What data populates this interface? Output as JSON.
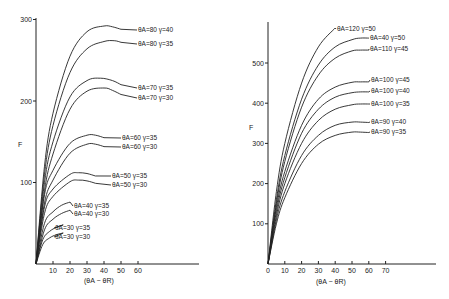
{
  "chart_data": [
    {
      "type": "line",
      "title": "",
      "xlabel": "(θA − θR)",
      "ylabel": "F",
      "xlim": [
        0,
        95
      ],
      "ylim": [
        0,
        300
      ],
      "x_ticks": [
        10,
        20,
        30,
        40,
        50,
        60
      ],
      "y_ticks": [
        100,
        200,
        300
      ],
      "grid": false,
      "legend_position": "inline labels at curve ends",
      "series": [
        {
          "name": "θA=80 γ=40",
          "x": [
            0,
            5,
            10,
            20,
            30,
            40,
            45,
            50
          ],
          "y": [
            0,
            120,
            185,
            255,
            285,
            292,
            291,
            288
          ]
        },
        {
          "name": "θA=80 γ=35",
          "x": [
            0,
            5,
            10,
            20,
            30,
            40,
            46,
            50
          ],
          "y": [
            0,
            110,
            170,
            235,
            264,
            273,
            274,
            272
          ]
        },
        {
          "name": "θA=70 γ=35",
          "x": [
            0,
            5,
            10,
            20,
            30,
            38,
            45,
            50
          ],
          "y": [
            0,
            100,
            150,
            205,
            225,
            228,
            225,
            220
          ]
        },
        {
          "name": "θA=70 γ=30",
          "x": [
            0,
            5,
            10,
            20,
            30,
            40,
            45,
            50
          ],
          "y": [
            0,
            90,
            135,
            190,
            212,
            216,
            213,
            208
          ]
        },
        {
          "name": "θA=60 γ=35",
          "x": [
            0,
            5,
            10,
            20,
            30,
            35,
            40
          ],
          "y": [
            0,
            85,
            115,
            148,
            158,
            158,
            155
          ]
        },
        {
          "name": "θA=60 γ=30",
          "x": [
            0,
            5,
            10,
            20,
            30,
            35,
            40
          ],
          "y": [
            0,
            75,
            103,
            136,
            147,
            147,
            144
          ]
        },
        {
          "name": "θA=50 γ=35",
          "x": [
            0,
            5,
            10,
            20,
            25,
            30,
            35
          ],
          "y": [
            0,
            70,
            92,
            110,
            112,
            111,
            108
          ]
        },
        {
          "name": "θA=50 γ=30",
          "x": [
            0,
            5,
            10,
            20,
            25,
            30,
            35
          ],
          "y": [
            0,
            62,
            83,
            101,
            103,
            102,
            99
          ]
        },
        {
          "name": "θA=40 γ=35",
          "x": [
            0,
            5,
            10,
            15,
            20
          ],
          "y": [
            0,
            50,
            64,
            72,
            76
          ]
        },
        {
          "name": "θA=40 γ=30",
          "x": [
            0,
            5,
            10,
            15,
            20
          ],
          "y": [
            0,
            42,
            55,
            62,
            66
          ]
        },
        {
          "name": "θA=30 γ=35",
          "x": [
            0,
            4,
            8,
            12,
            16
          ],
          "y": [
            0,
            30,
            40,
            45,
            48
          ]
        },
        {
          "name": "θA=30 γ=30",
          "x": [
            0,
            4,
            8,
            12,
            16
          ],
          "y": [
            0,
            24,
            32,
            36,
            38
          ]
        }
      ]
    },
    {
      "type": "line",
      "title": "",
      "xlabel": "(θA − θR)",
      "ylabel": "F",
      "xlim": [
        0,
        100
      ],
      "ylim": [
        0,
        600
      ],
      "x_ticks": [
        0,
        10,
        20,
        30,
        40,
        50,
        60,
        70
      ],
      "y_ticks": [
        100,
        200,
        300,
        400,
        500
      ],
      "grid": false,
      "legend_position": "inline labels at curve ends",
      "series": [
        {
          "name": "θA=120 γ=50",
          "x": [
            0,
            5,
            10,
            20,
            30,
            40
          ],
          "y": [
            0,
            180,
            300,
            450,
            540,
            587
          ]
        },
        {
          "name": "θA=40 γ=50",
          "x": [
            0,
            5,
            10,
            20,
            30,
            40,
            50,
            55,
            60
          ],
          "y": [
            0,
            160,
            270,
            410,
            495,
            540,
            558,
            562,
            562
          ]
        },
        {
          "name": "θA=110 γ=45",
          "x": [
            0,
            5,
            10,
            20,
            30,
            40,
            50,
            55,
            60
          ],
          "y": [
            0,
            150,
            255,
            390,
            470,
            512,
            530,
            532,
            532
          ]
        },
        {
          "name": "θA=100 γ=45",
          "x": [
            0,
            5,
            10,
            20,
            30,
            40,
            50,
            55,
            60
          ],
          "y": [
            0,
            140,
            230,
            345,
            410,
            440,
            452,
            453,
            453
          ]
        },
        {
          "name": "θA=100 γ=40",
          "x": [
            0,
            5,
            10,
            20,
            30,
            40,
            50,
            55,
            60
          ],
          "y": [
            0,
            130,
            215,
            325,
            385,
            415,
            426,
            428,
            428
          ]
        },
        {
          "name": "θA=100 γ=35",
          "x": [
            0,
            5,
            10,
            20,
            30,
            40,
            50,
            55,
            60
          ],
          "y": [
            0,
            120,
            200,
            300,
            357,
            385,
            396,
            398,
            398
          ]
        },
        {
          "name": "θA=90 γ=40",
          "x": [
            0,
            5,
            10,
            20,
            30,
            40,
            50,
            55,
            60
          ],
          "y": [
            0,
            110,
            180,
            270,
            320,
            345,
            353,
            353,
            352
          ]
        },
        {
          "name": "θA=90 γ=35",
          "x": [
            0,
            5,
            10,
            20,
            30,
            40,
            50,
            55,
            60
          ],
          "y": [
            0,
            100,
            165,
            250,
            298,
            320,
            328,
            328,
            327
          ]
        }
      ]
    }
  ],
  "left_chart": {
    "y_axis_label": "F",
    "x_axis_label": "(θA − θR)",
    "y_tick_labels": [
      "100",
      "200",
      "300"
    ],
    "x_tick_labels": [
      "10",
      "20",
      "30",
      "40",
      "50",
      "60"
    ],
    "series_labels": [
      "θA=80 γ=40",
      "θA=80 γ=35",
      "θA=70 γ=35",
      "θA=70 γ=30",
      "θA=60 γ=35",
      "θA=60 γ=30",
      "θA=50 γ=35",
      "θA=50 γ=30",
      "θA=40 γ=35",
      "θA=40 γ=30",
      "θA=30 γ=35",
      "θA=30 γ=30"
    ]
  },
  "right_chart": {
    "y_axis_label": "F",
    "x_axis_label": "(θA − θR)",
    "y_tick_labels": [
      "100",
      "200",
      "300",
      "400",
      "500"
    ],
    "x_tick_labels": [
      "0",
      "10",
      "20",
      "30",
      "40",
      "50",
      "60",
      "70"
    ],
    "series_labels": [
      "θA=120 γ=50",
      "θA=40 γ=50",
      "θA=110 γ=45",
      "θA=100 γ=45",
      "θA=100 γ=40",
      "θA=100 γ=35",
      "θA=90 γ=40",
      "θA=90 γ=35"
    ]
  }
}
